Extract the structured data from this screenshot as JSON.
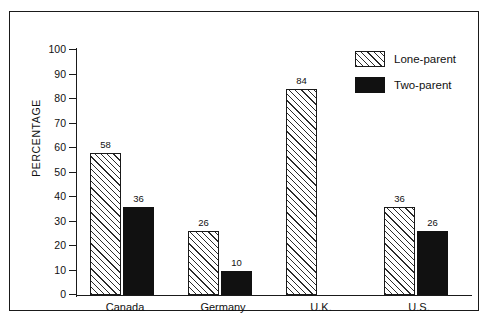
{
  "chart_data": {
    "type": "bar",
    "title": "",
    "xlabel": "",
    "ylabel": "PERCENTAGE",
    "ylim": [
      0,
      100
    ],
    "ytick_step": 10,
    "yticks": [
      0,
      10,
      20,
      30,
      40,
      50,
      60,
      70,
      80,
      90,
      100
    ],
    "grid": false,
    "legend_position": "top-right",
    "categories": [
      "Canada",
      "Germany",
      "U.K.",
      "U.S."
    ],
    "series": [
      {
        "name": "Lone-parent",
        "pattern": "diagonal-hatch",
        "color": "#ffffff",
        "edge_color": "#1a1a1a",
        "values": [
          58,
          26,
          84,
          36
        ],
        "labels": [
          "58",
          "26",
          "84",
          "36"
        ]
      },
      {
        "name": "Two-parent",
        "pattern": "solid",
        "color": "#111111",
        "edge_color": "#111111",
        "values": [
          36,
          10,
          null,
          26
        ],
        "labels": [
          "36",
          "10",
          "",
          "26"
        ]
      }
    ]
  },
  "legend": {
    "items": [
      {
        "label": "Lone-parent",
        "swatch": "hatched-swatch"
      },
      {
        "label": "Two-parent",
        "swatch": "solid-black-swatch"
      }
    ]
  },
  "axis": {
    "y_title": "PERCENTAGE",
    "tick_labels": [
      "100",
      "90",
      "80",
      "70",
      "60",
      "50",
      "40",
      "30",
      "20",
      "10",
      "0"
    ]
  }
}
